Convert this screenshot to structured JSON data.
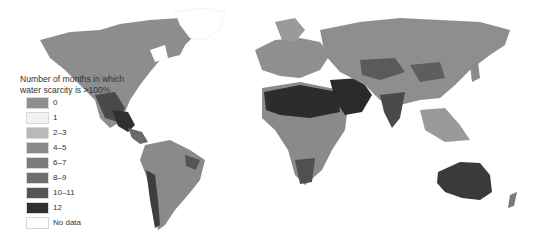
{
  "map": {
    "title": "Number of months in which water scarcity is >100%",
    "type": "choropleth world map"
  },
  "legend": {
    "title_line1": "Number of months in which",
    "title_line2": "water scarcity is >100%",
    "items": [
      {
        "label": "0",
        "color": "#8f8f8f"
      },
      {
        "label": "1",
        "color": "#f2f2f2"
      },
      {
        "label": "2–3",
        "color": "#b9b9b9"
      },
      {
        "label": "4–5",
        "color": "#8a8a8a"
      },
      {
        "label": "6–7",
        "color": "#7c7c7c"
      },
      {
        "label": "8–9",
        "color": "#6e6e6e"
      },
      {
        "label": "10–11",
        "color": "#545454"
      },
      {
        "label": "12",
        "color": "#2f2f2f"
      },
      {
        "label": "No data",
        "color": "#ffffff"
      }
    ]
  }
}
